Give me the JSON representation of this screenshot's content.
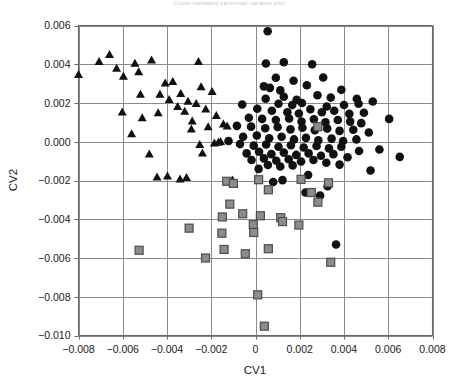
{
  "chart": {
    "title": "Cross-validated canonical variates plot",
    "xlabel": "CV1",
    "ylabel": "CV2"
  },
  "chart_data": {
    "type": "scatter",
    "title": "Cross-validated canonical variates plot",
    "xlabel": "CV1",
    "ylabel": "CV2",
    "xlim": [
      -0.008,
      0.008
    ],
    "ylim": [
      -0.01,
      0.006
    ],
    "xticks": [
      -0.008,
      -0.006,
      -0.004,
      -0.002,
      0,
      0.002,
      0.004,
      0.006,
      0.008
    ],
    "xticklabels": [
      "−0.008",
      "−0.006",
      "−0.004",
      "−0.002",
      "0",
      "0.002",
      "0.004",
      "0.006",
      "0.008"
    ],
    "yticks": [
      0.006,
      0.004,
      0.002,
      0.0,
      -0.002,
      -0.004,
      -0.006,
      -0.008,
      -0.01
    ],
    "yticklabels": [
      "0.006",
      "0.004",
      "0.002",
      "0.000",
      "−0.002",
      "−0.004",
      "−0.006",
      "−0.008",
      "−0.010"
    ],
    "grid": true,
    "legend": null,
    "colors": {
      "triangle_fill": "#111111",
      "circle_fill": "#111111",
      "square_fill": "#8c8c8c",
      "square_stroke": "#4d4d4d",
      "grid": "#8a8a8a",
      "frame": "#6a6a6a"
    },
    "series": [
      {
        "name": "Group A",
        "marker": "triangle",
        "color": "#111111",
        "points": [
          [
            -0.008,
            0.00345
          ],
          [
            -0.00707,
            0.00413
          ],
          [
            -0.0066,
            0.00449
          ],
          [
            -0.00628,
            0.00378
          ],
          [
            -0.00597,
            0.00337
          ],
          [
            -0.00545,
            0.00404
          ],
          [
            -0.00528,
            0.0036
          ],
          [
            -0.0052,
            0.00243
          ],
          [
            -0.0047,
            0.0042
          ],
          [
            -0.00432,
            0.00243
          ],
          [
            -0.00408,
            0.00302
          ],
          [
            -0.0039,
            0.00216
          ],
          [
            -0.00374,
            0.0031
          ],
          [
            -0.00352,
            0.0018
          ],
          [
            -0.00338,
            0.00247
          ],
          [
            -0.0032,
            0.00156
          ],
          [
            -0.00305,
            0.00208
          ],
          [
            -0.00286,
            0.00106
          ],
          [
            -0.00268,
            0.00196
          ],
          [
            -0.00258,
            0.00412
          ],
          [
            -0.00246,
            0.00282
          ],
          [
            -0.00225,
            0.00168
          ],
          [
            -0.00214,
            0.00076
          ],
          [
            -0.00196,
            0.00258
          ],
          [
            -0.00177,
            0.00134
          ],
          [
            -0.00602,
            0.00152
          ],
          [
            -0.0056,
            0.0004
          ],
          [
            -0.00512,
            0.00122
          ],
          [
            -0.0048,
            -0.00065
          ],
          [
            -0.00445,
            -0.00184
          ],
          [
            -0.00398,
            -0.00178
          ],
          [
            -0.00341,
            -0.00194
          ],
          [
            -0.00312,
            -0.00186
          ],
          [
            -0.0029,
            0.00064
          ],
          [
            -0.00252,
            -0.00016
          ],
          [
            -0.0024,
            -0.0006
          ],
          [
            -0.00186,
            -8e-05
          ],
          [
            -0.00168,
            -4e-05
          ],
          [
            -0.00158,
            0.0
          ],
          [
            -0.00104,
            -0.00199
          ],
          [
            -0.00145,
            0.0009
          ],
          [
            -0.00128,
            0.0008
          ],
          [
            -0.0044,
            0.00148
          ]
        ]
      },
      {
        "name": "Group B",
        "marker": "circle",
        "color": "#111111",
        "points": [
          [
            0.00055,
            0.0057
          ],
          [
            0.00047,
            0.00404
          ],
          [
            0.00128,
            0.0041
          ],
          [
            0.00256,
            0.004
          ],
          [
            0.00092,
            0.0033
          ],
          [
            0.00172,
            0.00315
          ],
          [
            0.00306,
            0.00332
          ],
          [
            0.00038,
            0.00286
          ],
          [
            0.00065,
            0.00278
          ],
          [
            0.00112,
            0.00265
          ],
          [
            0.00232,
            0.00292
          ],
          [
            0.00388,
            0.00268
          ],
          [
            0.00128,
            0.00232
          ],
          [
            0.00046,
            0.00222
          ],
          [
            0.00186,
            0.00216
          ],
          [
            0.0028,
            0.0024
          ],
          [
            0.0034,
            0.00228
          ],
          [
            0.00458,
            0.00222
          ],
          [
            0.00104,
            0.00196
          ],
          [
            0.00166,
            0.0019
          ],
          [
            0.0021,
            0.002
          ],
          [
            0.00322,
            0.00182
          ],
          [
            0.004,
            0.0019
          ],
          [
            0.00466,
            0.00196
          ],
          [
            0.0053,
            0.00208
          ],
          [
            -0.0006,
            0.00192
          ],
          [
            8e-05,
            0.0017
          ],
          [
            0.00074,
            0.0016
          ],
          [
            0.00144,
            0.00152
          ],
          [
            0.00196,
            0.00146
          ],
          [
            0.00248,
            0.00168
          ],
          [
            0.003,
            0.00152
          ],
          [
            0.00356,
            0.0016
          ],
          [
            0.00424,
            0.00144
          ],
          [
            0.0049,
            0.0015
          ],
          [
            0.00604,
            0.00118
          ],
          [
            -0.0003,
            0.00124
          ],
          [
            0.0003,
            0.00118
          ],
          [
            0.00092,
            0.00112
          ],
          [
            0.00152,
            0.0012
          ],
          [
            0.00208,
            0.00104
          ],
          [
            0.00264,
            0.00116
          ],
          [
            0.00316,
            0.001
          ],
          [
            0.00372,
            0.00112
          ],
          [
            0.00428,
            0.00104
          ],
          [
            0.00478,
            0.00096
          ],
          [
            -0.00084,
            0.00082
          ],
          [
            -0.0002,
            0.00078
          ],
          [
            0.00044,
            0.0007
          ],
          [
            0.001,
            0.00076
          ],
          [
            0.00158,
            0.00064
          ],
          [
            0.00212,
            0.00072
          ],
          [
            0.00268,
            0.0006
          ],
          [
            0.00324,
            0.00068
          ],
          [
            0.0038,
            0.00056
          ],
          [
            0.00442,
            0.00062
          ],
          [
            0.00512,
            0.00048
          ],
          [
            -0.00056,
            0.00026
          ],
          [
            6e-05,
            0.00032
          ],
          [
            0.00062,
            0.00018
          ],
          [
            0.00118,
            0.00026
          ],
          [
            0.00174,
            0.00012
          ],
          [
            0.00228,
            0.0002
          ],
          [
            0.00284,
            8e-05
          ],
          [
            0.00344,
            0.00016
          ],
          [
            0.00396,
            4e-05
          ],
          [
            0.00456,
            0.00012
          ],
          [
            -0.00122,
            4e-05
          ],
          [
            -0.0007,
            -0.00012
          ],
          [
            -8e-05,
            -0.0002
          ],
          [
            0.00048,
            -0.00014
          ],
          [
            0.00104,
            -0.00026
          ],
          [
            0.0016,
            -0.00018
          ],
          [
            0.00218,
            -0.0003
          ],
          [
            0.00276,
            -0.00022
          ],
          [
            0.00332,
            -0.00034
          ],
          [
            0.00388,
            -0.00026
          ],
          [
            0.00468,
            -0.00048
          ],
          [
            0.0056,
            -0.0004
          ],
          [
            0.00652,
            -0.00078
          ],
          [
            -0.0004,
            -0.0006
          ],
          [
            0.00016,
            -0.00052
          ],
          [
            0.00072,
            -0.00064
          ],
          [
            0.00128,
            -0.00056
          ],
          [
            0.00184,
            -0.00068
          ],
          [
            0.0024,
            -0.0006
          ],
          [
            0.00296,
            -0.00072
          ],
          [
            0.00352,
            -0.00064
          ],
          [
            0.00416,
            -0.0008
          ],
          [
            -0.00018,
            -0.00094
          ],
          [
            0.00038,
            -0.00086
          ],
          [
            0.00094,
            -0.00098
          ],
          [
            0.0015,
            -0.0009
          ],
          [
            0.00206,
            -0.00102
          ],
          [
            0.00262,
            -0.00094
          ],
          [
            0.0032,
            -0.00108
          ],
          [
            0.0038,
            -0.00118
          ],
          [
            0.0052,
            -0.00148
          ],
          [
            0.00056,
            -0.0012
          ],
          [
            0.00112,
            -0.00128
          ],
          [
            0.00168,
            -0.00122
          ],
          [
            0.00014,
            -0.0014
          ],
          [
            0.00238,
            -0.00172
          ],
          [
            0.00122,
            -0.00198
          ],
          [
            0.00326,
            -0.0023
          ],
          [
            0.00226,
            -0.00262
          ],
          [
            0.00292,
            -0.00278
          ],
          [
            0.00364,
            -0.0053
          ],
          [
            0.0008,
            -0.00208
          ]
        ]
      },
      {
        "name": "Group C",
        "marker": "square",
        "color": "#8c8c8c",
        "points": [
          [
            0.00282,
            0.00078
          ],
          [
            0.0033,
            -0.00212
          ],
          [
            -0.0013,
            -0.00204
          ],
          [
            -0.001,
            -0.00215
          ],
          [
            0.00014,
            -0.00196
          ],
          [
            0.00206,
            -0.00194
          ],
          [
            0.00058,
            -0.00248
          ],
          [
            0.00252,
            -0.00262
          ],
          [
            0.00282,
            -0.00312
          ],
          [
            -0.00116,
            -0.00322
          ],
          [
            -0.0015,
            -0.00388
          ],
          [
            -0.00058,
            -0.00372
          ],
          [
            0.00022,
            -0.00382
          ],
          [
            0.00114,
            -0.00392
          ],
          [
            0.00122,
            -0.00412
          ],
          [
            -0.0001,
            -0.00428
          ],
          [
            0.00196,
            -0.0043
          ],
          [
            -0.003,
            -0.00446
          ],
          [
            -0.00152,
            -0.00472
          ],
          [
            -8e-05,
            -0.00468
          ],
          [
            -0.00526,
            -0.0056
          ],
          [
            -0.00142,
            -0.00556
          ],
          [
            -0.00046,
            -0.00578
          ],
          [
            0.00058,
            -0.00552
          ],
          [
            -0.00226,
            -0.006
          ],
          [
            0.0034,
            -0.00622
          ],
          [
            0.0001,
            -0.0079
          ],
          [
            0.0004,
            -0.00952
          ]
        ]
      }
    ]
  }
}
